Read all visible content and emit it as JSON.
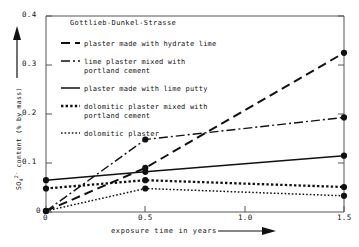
{
  "chart_data": {
    "type": "line",
    "title": "Gottlieb-Dunkel-Strasse",
    "xlabel": "exposure time in years",
    "ylabel": "SO4 2- content (% by mass)",
    "ylabel_base": "SO",
    "ylabel_sub": "4",
    "ylabel_sup": "2-",
    "ylabel_rest": " content (% by mass)",
    "xlim": [
      0,
      1.5
    ],
    "ylim": [
      0,
      0.4
    ],
    "grid": false,
    "legend_position": "upper-left-inside",
    "xticks": [
      "0",
      "0.5",
      "1.0",
      "1.5"
    ],
    "xtick_values": [
      0,
      0.5,
      1.0,
      1.5
    ],
    "yticks": [
      "0",
      "0.1",
      "0.2",
      "0.3",
      "0.4"
    ],
    "ytick_values": [
      0,
      0.1,
      0.2,
      0.3,
      0.4
    ],
    "x": [
      0,
      0.5,
      1.5
    ],
    "series": [
      {
        "name": "plaster made with hydrate lime",
        "style": "dashed",
        "values": [
          0.002,
          0.09,
          0.325
        ]
      },
      {
        "name": "lime plaster mixed with portland cement",
        "style": "dash-dot",
        "values": [
          0.002,
          0.148,
          0.193
        ]
      },
      {
        "name": "plaster made with lime putty",
        "style": "solid",
        "values": [
          0.065,
          0.082,
          0.115
        ]
      },
      {
        "name": "dolomitic plaster mixed with portland cement",
        "style": "dotted-bold",
        "values": [
          0.048,
          0.065,
          0.051
        ]
      },
      {
        "name": "dolomitic plaster",
        "style": "dotted-fine",
        "values": [
          0.002,
          0.048,
          0.033
        ]
      }
    ]
  },
  "legend": {
    "items": [
      {
        "label": "plaster made with hydrate lime",
        "style": "dashed"
      },
      {
        "label_line1": "lime plaster mixed with",
        "label_line2": "portland cement",
        "style": "dash-dot"
      },
      {
        "label": "plaster made with lime putty",
        "style": "solid"
      },
      {
        "label_line1": "dolomitic plaster mixed with",
        "label_line2": "portland cement",
        "style": "dotted-bold"
      },
      {
        "label": "dolomitic plaster",
        "style": "dotted-fine"
      }
    ]
  },
  "colors": {
    "ink": "#111111",
    "axis": "#555555",
    "background": "#ffffff"
  }
}
